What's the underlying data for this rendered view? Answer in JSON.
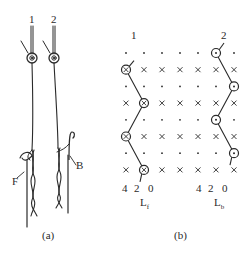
{
  "panel_a": {
    "caption": "(a)",
    "needle_labels": [
      "1",
      "2"
    ],
    "front_bar_label": "F",
    "back_bar_label": "B"
  },
  "panel_b": {
    "caption": "(b)",
    "bar_labels": [
      "1",
      "2"
    ],
    "grid": {
      "columns": 7,
      "rows": 8,
      "row_types": [
        "dot",
        "cross",
        "dot",
        "cross",
        "dot",
        "cross",
        "dot",
        "cross"
      ]
    },
    "front_bar": {
      "symbol": "circled-x",
      "lap_points": [
        [
          0,
          1
        ],
        [
          1,
          3
        ],
        [
          0,
          5
        ],
        [
          1,
          7
        ]
      ],
      "scale": [
        "4",
        "2",
        "0"
      ],
      "label_main": "L",
      "label_sub": "f"
    },
    "back_bar": {
      "symbol": "circled-dot",
      "lap_points": [
        [
          5,
          0
        ],
        [
          6,
          2
        ],
        [
          5,
          4
        ],
        [
          6,
          6
        ]
      ],
      "scale": [
        "4",
        "2",
        "0"
      ],
      "label_main": "L",
      "label_sub": "b"
    }
  },
  "colors": {
    "ink": "#2a2a2a",
    "background": "#ffffff"
  }
}
